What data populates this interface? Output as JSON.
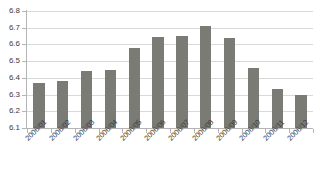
{
  "chart_data": {
    "type": "bar",
    "title": "",
    "subtitle": "",
    "xlabel": "",
    "ylabel": "",
    "categories": [
      "2006/01",
      "2006/02",
      "2006/03",
      "2006/04",
      "2006/05",
      "2006/06",
      "2006/07",
      "2006/08",
      "2006/09",
      "2006/10",
      "2006/11",
      "2006/12"
    ],
    "values": [
      6.37,
      6.38,
      6.44,
      6.45,
      6.58,
      6.645,
      6.65,
      6.71,
      6.64,
      6.46,
      6.335,
      6.3
    ],
    "ylim": [
      6.1,
      6.8
    ],
    "ytick_labels": [
      "6.8",
      "6.7",
      "6.6",
      "6.5",
      "6.4",
      "6.3",
      "6.2",
      "6.1"
    ],
    "ytick_values": [
      6.8,
      6.7,
      6.6,
      6.5,
      6.4,
      6.3,
      6.2,
      6.1
    ],
    "grid": true,
    "legend": false,
    "legend_position": "none",
    "bar_color": "#7b7b76",
    "grid_color": "#d9d9d9",
    "axis_color": "#b4b4b4",
    "text_color": "#3c3c3c",
    "xtick_rotation": -45
  }
}
